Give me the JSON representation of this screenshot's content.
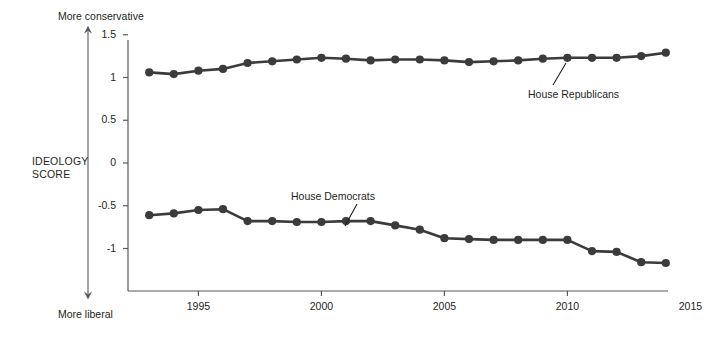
{
  "chart": {
    "axis_title_line1": "IDEOLOGY",
    "axis_title_line2": "SCORE",
    "top_annotation": "More conservative",
    "bottom_annotation": "More liberal",
    "series_label_republicans": "House Republicans",
    "series_label_democrats": "House Democrats",
    "y_tick_labels": [
      "1.5",
      "1",
      "0.5",
      "0",
      "-0.5",
      "-1"
    ],
    "x_tick_labels": [
      "1995",
      "2000",
      "2005",
      "2010",
      "2015"
    ],
    "line_color": "#3b3b3b",
    "axis_color": "#58595b"
  },
  "chart_data": {
    "type": "line",
    "title": "",
    "subtitle": "",
    "xlabel": "",
    "ylabel": "IDEOLOGY SCORE",
    "xlim": [
      1992.3,
      2015.5
    ],
    "ylim": [
      -1.3,
      1.55
    ],
    "y_ticks": [
      1.5,
      1,
      0.5,
      0,
      -0.5,
      -1
    ],
    "x_ticks": [
      1995,
      2000,
      2005,
      2010,
      2015
    ],
    "grid": false,
    "legend": "inline-annotations",
    "annotations": [
      {
        "text": "More conservative",
        "position": "above-y-axis"
      },
      {
        "text": "More liberal",
        "position": "below-x-axis"
      },
      {
        "text": "House Republicans",
        "points_to": "republican series right end"
      },
      {
        "text": "House Democrats",
        "points_to": "democrat series mid"
      }
    ],
    "x": [
      1993,
      1994,
      1995,
      1996,
      1997,
      1998,
      1999,
      2000,
      2001,
      2002,
      2003,
      2004,
      2005,
      2006,
      2007,
      2008,
      2009,
      2010,
      2011,
      2012,
      2013,
      2014
    ],
    "series": [
      {
        "name": "House Republicans",
        "color": "#3b3b3b",
        "values": [
          1.06,
          1.04,
          1.08,
          1.1,
          1.17,
          1.19,
          1.21,
          1.23,
          1.22,
          1.2,
          1.21,
          1.21,
          1.2,
          1.18,
          1.19,
          1.2,
          1.22,
          1.23,
          1.23,
          1.23,
          1.25,
          1.29
        ]
      },
      {
        "name": "House Democrats",
        "color": "#3b3b3b",
        "values": [
          -0.61,
          -0.59,
          -0.55,
          -0.54,
          -0.68,
          -0.68,
          -0.69,
          -0.69,
          -0.68,
          -0.68,
          -0.73,
          -0.78,
          -0.88,
          -0.89,
          -0.9,
          -0.9,
          -0.9,
          -0.9,
          -1.03,
          -1.04,
          -1.16,
          -1.17
        ]
      }
    ]
  }
}
